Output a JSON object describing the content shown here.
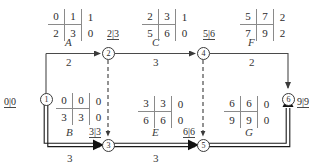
{
  "diagram": {
    "type": "activity-on-arrow-network",
    "title": "",
    "nodes": [
      {
        "id": "1",
        "label": "1",
        "x": 46,
        "y": 99
      },
      {
        "id": "2",
        "label": "2",
        "x": 108,
        "y": 53
      },
      {
        "id": "3",
        "label": "3",
        "x": 108,
        "y": 145
      },
      {
        "id": "4",
        "label": "4",
        "x": 203,
        "y": 53
      },
      {
        "id": "5",
        "label": "5",
        "x": 203,
        "y": 145
      },
      {
        "id": "6",
        "label": "6",
        "x": 288,
        "y": 99
      }
    ],
    "activities": [
      {
        "name": "A",
        "duration": "2",
        "from": "1",
        "to": "2",
        "critical": false
      },
      {
        "name": "C",
        "duration": "3",
        "from": "2",
        "to": "4",
        "critical": false
      },
      {
        "name": "F",
        "duration": "2",
        "from": "4",
        "to": "6",
        "critical": false
      },
      {
        "name": "B",
        "duration": "3",
        "from": "1",
        "to": "3",
        "critical": true
      },
      {
        "name": "E",
        "duration": "3",
        "from": "3",
        "to": "5",
        "critical": true
      },
      {
        "name": "G",
        "duration": "",
        "from": "5",
        "to": "6",
        "critical": true
      }
    ],
    "dummies": [
      {
        "from": "2",
        "to": "3"
      },
      {
        "from": "4",
        "to": "5"
      }
    ],
    "time_labels": [
      {
        "name": "node-1-times",
        "text": "0|0"
      },
      {
        "name": "node-2-times",
        "text": "2|3"
      },
      {
        "name": "node-3-times",
        "text": "3|3"
      },
      {
        "name": "node-4-times",
        "text": "5|6"
      },
      {
        "name": "node-5-times",
        "text": "6|6"
      },
      {
        "name": "node-6-times",
        "text": "9|9"
      }
    ],
    "matrices": [
      {
        "name": "matrix-activity-a",
        "top": [
          "0",
          "1",
          "1"
        ],
        "bottom": [
          "2",
          "3",
          "0"
        ]
      },
      {
        "name": "matrix-activity-c",
        "top": [
          "2",
          "3",
          "1"
        ],
        "bottom": [
          "5",
          "6",
          "0"
        ]
      },
      {
        "name": "matrix-activity-f",
        "top": [
          "5",
          "7",
          "2"
        ],
        "bottom": [
          "7",
          "9",
          "2"
        ]
      },
      {
        "name": "matrix-activity-b",
        "top": [
          "0",
          "0",
          "0"
        ],
        "bottom": [
          "3",
          "3",
          "0"
        ]
      },
      {
        "name": "matrix-activity-e",
        "top": [
          "3",
          "3",
          "0"
        ],
        "bottom": [
          "6",
          "6",
          "0"
        ]
      },
      {
        "name": "matrix-activity-g",
        "top": [
          "6",
          "6",
          "0"
        ],
        "bottom": [
          "9",
          "9",
          "0"
        ]
      }
    ],
    "colors": {
      "line": "#4a4a4a",
      "critical_line": "#1a1a1a",
      "text": "#2b2b2b",
      "background": "#ffffff"
    }
  }
}
